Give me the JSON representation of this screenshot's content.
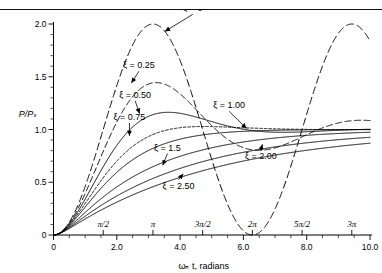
{
  "caption": {
    "top_partial_text": ""
  },
  "chart_data": {
    "type": "line",
    "title": "",
    "xlabel": "ωₙ t, radians",
    "ylabel": "P/Pₛ",
    "xlim": [
      0,
      10.0
    ],
    "ylim": [
      0,
      2.0
    ],
    "grid": false,
    "legend": "inline-curve-labels",
    "x_ticks_numeric": [
      "0",
      "2.0",
      "4.0",
      "6.0",
      "8.0",
      "10.0"
    ],
    "x_tick_values_numeric": [
      0,
      2.0,
      4.0,
      6.0,
      8.0,
      10.0
    ],
    "x_ticks_pi": [
      "π/2",
      "π",
      "3π/2",
      "2π",
      "5π/2",
      "3π"
    ],
    "x_tick_values_pi": [
      1.5708,
      3.1416,
      4.7124,
      6.2832,
      7.854,
      9.4248
    ],
    "x_minor_step": 0.5,
    "y_ticks": [
      "0",
      "0.5",
      "1.0",
      "1.5",
      "2.0"
    ],
    "y_tick_values": [
      0,
      0.5,
      1.0,
      1.5,
      2.0
    ],
    "y_minor_step": 0.1,
    "series": [
      {
        "name": "ξ = 0",
        "zeta": 0,
        "dash": "7 4",
        "label": "ξ = 0",
        "label_x": 4.4,
        "label_y": 2.12,
        "tip_x": 3.52,
        "tip_y": 1.93
      },
      {
        "name": "ξ = 0.25",
        "zeta": 0.25,
        "dash": "6 3.5",
        "label": "ξ = 0.25",
        "label_x": 2.7,
        "label_y": 1.58,
        "tip_x": 2.46,
        "tip_y": 1.44
      },
      {
        "name": "ξ = 0.50",
        "zeta": 0.5,
        "dash": "0",
        "label": "ξ = 0.50",
        "label_x": 2.58,
        "label_y": 1.3,
        "tip_x": 2.72,
        "tip_y": 1.15
      },
      {
        "name": "ξ = 0.75",
        "zeta": 0.75,
        "dash": "2.5 2",
        "label": "ξ = 0.75",
        "label_x": 2.4,
        "label_y": 1.09,
        "tip_x": 2.4,
        "tip_y": 0.94
      },
      {
        "name": "ξ = 1.00",
        "zeta": 1.0,
        "dash": "0",
        "label": "ξ = 1.00",
        "label_x": 5.55,
        "label_y": 1.2,
        "tip_x": 6.1,
        "tip_y": 1.01
      },
      {
        "name": "ξ = 1.5",
        "zeta": 1.5,
        "dash": "0",
        "label": "ξ = 1.5",
        "label_x": 3.6,
        "label_y": 0.8,
        "tip_x": 3.45,
        "tip_y": 0.66
      },
      {
        "name": "ξ = 2.00",
        "zeta": 2.0,
        "dash": "0",
        "label": "ξ = 2.00",
        "label_x": 6.55,
        "label_y": 0.72,
        "tip_x": 6.6,
        "tip_y": 0.86
      },
      {
        "name": "ξ = 2.50",
        "zeta": 2.5,
        "dash": "0",
        "label": "ξ = 2.50",
        "label_x": 3.95,
        "label_y": 0.44,
        "tip_x": 4.1,
        "tip_y": 0.58
      }
    ]
  }
}
